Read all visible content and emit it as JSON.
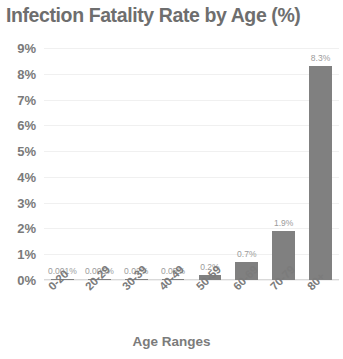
{
  "chart_data": {
    "type": "bar",
    "title": "Infection Fatality Rate by Age (%)",
    "xlabel": "Age Ranges",
    "ylabel": "",
    "categories": [
      "0-20",
      "20-29",
      "30-39",
      "40-49",
      "50-59",
      "60-69",
      "70-79",
      "80+"
    ],
    "values": [
      0.001,
      0.005,
      0.02,
      0.05,
      0.2,
      0.7,
      1.9,
      8.3
    ],
    "data_labels": [
      "0.001%",
      "0.005%",
      "0.02%",
      "0.05%",
      "0.2%",
      "0.7%",
      "1.9%",
      "8.3%"
    ],
    "ylim": [
      0,
      9
    ],
    "ytick_labels": [
      "0%",
      "1%",
      "2%",
      "3%",
      "4%",
      "5%",
      "6%",
      "7%",
      "8%",
      "9%"
    ],
    "ytick_values": [
      0,
      1,
      2,
      3,
      4,
      5,
      6,
      7,
      8,
      9
    ],
    "grid": true,
    "legend": false,
    "bar_color": "#808080",
    "text_color": "#7b7b7b",
    "label_color": "#9b9b9b",
    "grid_color": "#f0f0f0"
  }
}
